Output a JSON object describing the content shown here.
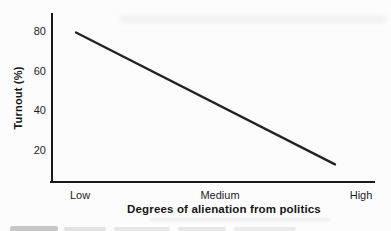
{
  "figure": {
    "background_color": "#fcfcfc",
    "ink_color": "#1a1a1a",
    "line_color": "#222222"
  },
  "chart_data": {
    "type": "line",
    "title": "",
    "xlabel": "Degrees of alienation from politics",
    "ylabel": "Turnout (%)",
    "x_axis_type": "category",
    "x_categories": [
      "Low",
      "Medium",
      "High"
    ],
    "y_ticks": [
      20,
      40,
      60,
      80
    ],
    "ylim": [
      0,
      90
    ],
    "grid": false,
    "legend": false,
    "annotations": [],
    "series": [
      {
        "name": "Turnout by degree of alienation",
        "shape": "single straight declining line, no markers",
        "points": [
          {
            "x": "Low",
            "y": 80
          },
          {
            "x": "High",
            "y": 13
          }
        ]
      }
    ]
  }
}
